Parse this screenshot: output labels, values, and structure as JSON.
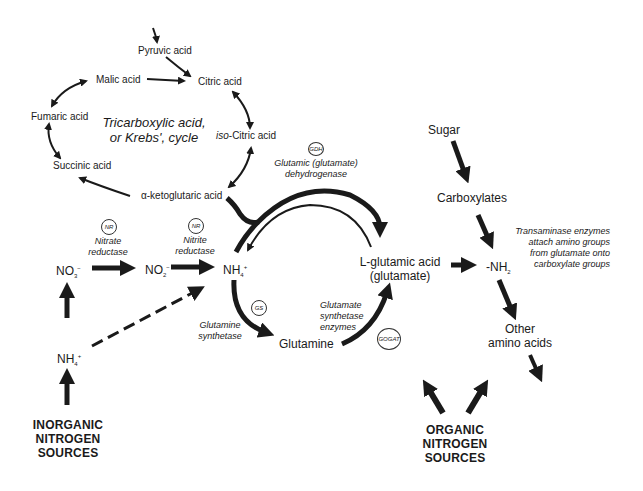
{
  "diagram": {
    "krebs_cycle": {
      "title_line1": "Tricarboxylic acid,",
      "title_line2": "or Krebs', cycle",
      "nodes": {
        "pyruvic": "Pyruvic acid",
        "citric": "Citric acid",
        "malic": "Malic acid",
        "fumaric": "Fumaric acid",
        "isocitric_prefix": "iso",
        "isocitric": "-Citric acid",
        "succinic": "Succinic acid",
        "ketoglutaric": "α-ketoglutaric acid"
      }
    },
    "enzymes": {
      "gdh_abbr": "GDH",
      "gdh_line1": "Glutamic (glutamate)",
      "gdh_line2": "dehydrogenase",
      "nr1_abbr": "NR",
      "nr1_line1": "Nitrate",
      "nr1_line2": "reductase",
      "nr2_abbr": "NR",
      "nr2_line1": "Nitrite",
      "nr2_line2": "reductase",
      "gs_abbr": "GS",
      "gs_line1": "Glutamine",
      "gs_line2": "synthetase",
      "gogat_abbr": "GOGAT",
      "gogat_line1": "Glutamate",
      "gogat_line2": "synthetase",
      "gogat_line3": "enzymes",
      "transaminase_line1": "Transaminase enzymes",
      "transaminase_line2": "attach amino groups",
      "transaminase_line3": "from glutamate onto",
      "transaminase_line4": "carboxylate groups"
    },
    "nitrogen": {
      "no3": "NO",
      "no3_sub": "3",
      "no3_sup": "−",
      "no2": "NO",
      "no2_sub": "2",
      "no2_sup": "−",
      "nh4_main": "NH",
      "nh4_main_sub": "4",
      "nh4_main_sup": "+",
      "nh4_source": "NH",
      "nh4_source_sub": "4",
      "nh4_source_sup": "+",
      "glutamine": "Glutamine",
      "glutamic_line1": "L-glutamic acid",
      "glutamic_line2": "(glutamate)",
      "nh2": "-NH",
      "nh2_sub": "2"
    },
    "organic": {
      "sugar": "Sugar",
      "carboxylates": "Carboxylates",
      "other_line1": "Other",
      "other_line2": "amino acids"
    },
    "sources": {
      "inorganic_line1": "INORGANIC",
      "inorganic_line2": "NITROGEN",
      "inorganic_line3": "SOURCES",
      "organic_line1": "ORGANIC",
      "organic_line2": "NITROGEN",
      "organic_line3": "SOURCES"
    },
    "colors": {
      "ink": "#1a1a1a",
      "background": "#ffffff"
    }
  }
}
